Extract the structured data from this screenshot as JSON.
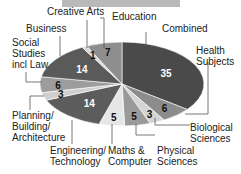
{
  "chart_data": {
    "type": "pie",
    "title": "",
    "start": "top",
    "direction": "clockwise",
    "slices": [
      {
        "label": "Combined",
        "value": 35,
        "color": "#4a4a4a",
        "text_color": "#ffffff"
      },
      {
        "label": "Health Subjects",
        "value": 6,
        "color": "#8c8c8c",
        "text_color": "#111111"
      },
      {
        "label": "Biological Sciences",
        "value": 3,
        "color": "#d4d4d4",
        "text_color": "#111111"
      },
      {
        "label": "Physical Sciences",
        "value": 5,
        "color": "#9a9a9a",
        "text_color": "#111111"
      },
      {
        "label": "Maths & Computer",
        "value": 5,
        "color": "#e6e6e6",
        "text_color": "#111111"
      },
      {
        "label": "Engineering/ Technology",
        "value": 14,
        "color": "#5c5c5c",
        "text_color": "#ffffff"
      },
      {
        "label": "Planning/ Building/ Architecture",
        "value": 3,
        "color": "#cfcfcf",
        "text_color": "#111111"
      },
      {
        "label": "Social Studies incl Law",
        "value": 6,
        "color": "#9c9c9c",
        "text_color": "#111111"
      },
      {
        "label": "Business",
        "value": 14,
        "color": "#5a5a5a",
        "text_color": "#ffffff"
      },
      {
        "label": "Creative Arts",
        "value": 1,
        "color": "#d8d8d8",
        "text_color": "#111111"
      },
      {
        "label": "Education",
        "value": 7,
        "color": "#8e8e8e",
        "text_color": "#111111"
      }
    ]
  },
  "labels": {
    "combined": "Combined",
    "health": [
      "Health",
      "Subjects"
    ],
    "biological": [
      "Biological",
      "Sciences"
    ],
    "physical": [
      "Physical",
      "Sciences"
    ],
    "maths": [
      "Maths &",
      "Computer"
    ],
    "engineering": [
      "Engineering/",
      "Technology"
    ],
    "planning": [
      "Planning/",
      "Building/",
      "Architecture"
    ],
    "social": [
      "Social",
      "Studies",
      "incl Law"
    ],
    "business": "Business",
    "creative": "Creative Arts",
    "education": "Education"
  }
}
